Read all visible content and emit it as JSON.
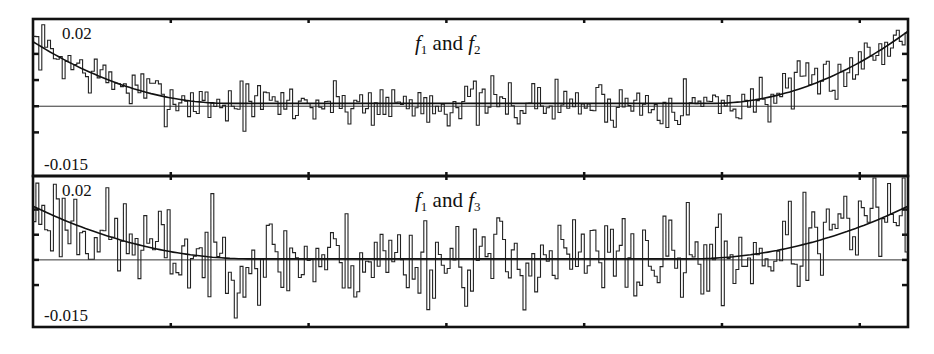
{
  "chart_data": [
    {
      "type": "line",
      "subtype": "histogram-with-fit",
      "title": "f1 and f2",
      "title_parts": {
        "a": "f",
        "a_sub": "1",
        "mid": " and ",
        "b": "f",
        "b_sub": "2"
      },
      "xlabel": "",
      "ylabel": "",
      "y_tick_labels": [
        "0.02",
        "-0.015"
      ],
      "ylim": [
        -0.02,
        0.025
      ],
      "xlim": [
        0,
        1
      ],
      "x_ticks_count": 7,
      "y_ticks": [
        0.015,
        0.0075,
        0,
        -0.0075
      ],
      "zero_line": 0,
      "n_bins": 300,
      "fit": {
        "form": "parabola",
        "y_left": 0.0185,
        "y_min": 0.0008,
        "x_min": 0.5,
        "y_right": 0.0215,
        "flat_width": 0.55
      },
      "noise_amplitude": 0.0042,
      "series": [
        {
          "name": "histogram",
          "style": "step"
        },
        {
          "name": "fit curve",
          "style": "smooth"
        },
        {
          "name": "zero reference",
          "style": "horizontal line"
        }
      ]
    },
    {
      "type": "line",
      "subtype": "histogram-with-fit",
      "title": "f1 and f3",
      "title_parts": {
        "a": "f",
        "a_sub": "1",
        "mid": " and ",
        "b": "f",
        "b_sub": "3"
      },
      "xlabel": "",
      "ylabel": "",
      "y_tick_labels": [
        "0.02",
        "-0.015"
      ],
      "ylim": [
        -0.02,
        0.025
      ],
      "xlim": [
        0,
        1
      ],
      "x_ticks_count": 7,
      "y_ticks": [
        0.015,
        0.0075,
        0,
        -0.0075
      ],
      "zero_line": 0,
      "n_bins": 300,
      "fit": {
        "form": "parabola",
        "y_left": 0.016,
        "y_min": 0.0003,
        "x_min": 0.5,
        "y_right": 0.016,
        "flat_width": 0.5
      },
      "noise_amplitude": 0.0085,
      "series": [
        {
          "name": "histogram",
          "style": "step"
        },
        {
          "name": "fit curve",
          "style": "smooth"
        },
        {
          "name": "zero reference",
          "style": "horizontal line"
        }
      ]
    }
  ]
}
